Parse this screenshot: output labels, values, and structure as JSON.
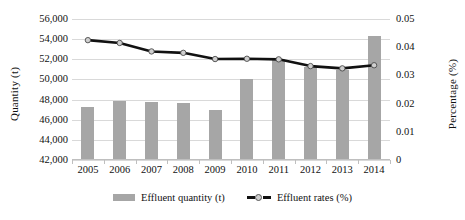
{
  "chart_data": {
    "type": "bar",
    "title": "",
    "subtitle": "",
    "xlabel": "",
    "ylabel": "Quantity (t)",
    "y2label": "Percentage (%)",
    "grid": true,
    "legend_position": "bottom",
    "categories": [
      "2005",
      "2006",
      "2007",
      "2008",
      "2009",
      "2010",
      "2011",
      "2012",
      "2013",
      "2014"
    ],
    "ylim": [
      42000,
      56000
    ],
    "y_ticks": [
      "42,000",
      "44,000",
      "46,000",
      "48,000",
      "50,000",
      "52,000",
      "54,000",
      "56,000"
    ],
    "y_tick_values": [
      42000,
      44000,
      46000,
      48000,
      50000,
      52000,
      54000,
      56000
    ],
    "y2lim": [
      0,
      0.05
    ],
    "y2_ticks": [
      "0",
      "0.01",
      "0.02",
      "0.03",
      "0.04",
      "0.05"
    ],
    "y2_tick_values": [
      0,
      0.01,
      0.02,
      0.03,
      0.04,
      0.05
    ],
    "series": [
      {
        "name": "Effluent quantity (t)",
        "type": "bar",
        "axis": "left",
        "color": "#a6a6a6",
        "values": [
          47300,
          47850,
          47750,
          47650,
          47000,
          50050,
          52050,
          51250,
          50900,
          54300
        ]
      },
      {
        "name": "Effluent rates (%)",
        "type": "line",
        "axis": "right",
        "color": "#111111",
        "marker_color": "#cfcfcf",
        "values": [
          0.0425,
          0.0415,
          0.0385,
          0.038,
          0.0358,
          0.0359,
          0.0357,
          0.0333,
          0.0325,
          0.0336
        ]
      }
    ]
  },
  "legend": {
    "entries": [
      {
        "label": "Effluent quantity (t)",
        "marker": "bar-swatch"
      },
      {
        "label": "Effluent rates (%)",
        "marker": "line-marker-swatch"
      }
    ]
  }
}
